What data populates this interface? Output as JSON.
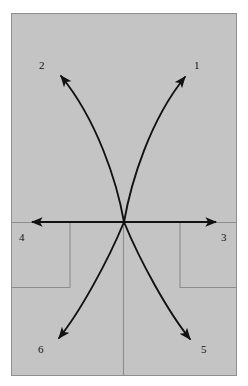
{
  "figure": {
    "type": "vector-diagram",
    "panel": {
      "background_color": "#c4c4c4",
      "border_color": "#8f8f8f",
      "x": 11,
      "y": 13,
      "width": 226,
      "height": 363
    },
    "page_background_color": "#ffffff",
    "stroke_color": "#121212",
    "guide_color": "#8d8d8d",
    "origin": {
      "x": 124,
      "y": 222
    },
    "axis": {
      "name": "horizontal-axis",
      "x_start": 30,
      "x_end": 218,
      "y": 222,
      "double_headed": true
    },
    "center_line": {
      "name": "vertical-guide",
      "x": 123,
      "y_start": 222,
      "y_end": 376
    },
    "guide_boxes": [
      {
        "name": "left-guide-box",
        "x": 11,
        "y": 222,
        "width": 59,
        "height": 65
      },
      {
        "name": "right-guide-box",
        "x": 180,
        "y": 222,
        "width": 57,
        "height": 65
      }
    ],
    "arrows": [
      {
        "id": "arrow-1",
        "label": "1",
        "direction": "upper-right",
        "curved": true,
        "path": "M124,222 C131,182 150,120 187,74",
        "tip": {
          "x": 187,
          "y": 74
        },
        "label_pos": {
          "x": 194,
          "y": 60
        }
      },
      {
        "id": "arrow-2",
        "label": "2",
        "direction": "upper-left",
        "curved": true,
        "path": "M124,222 C117,182 97,120 59,73",
        "tip": {
          "x": 59,
          "y": 73
        },
        "label_pos": {
          "x": 39,
          "y": 60
        }
      },
      {
        "id": "arrow-3",
        "label": "3",
        "direction": "right",
        "curved": false,
        "path": "M124,222 L218,222",
        "tip": {
          "x": 218,
          "y": 222
        },
        "label_pos": {
          "x": 221,
          "y": 232
        }
      },
      {
        "id": "arrow-4",
        "label": "4",
        "direction": "left",
        "curved": false,
        "path": "M124,222 L30,222",
        "tip": {
          "x": 30,
          "y": 222
        },
        "label_pos": {
          "x": 19,
          "y": 232
        }
      },
      {
        "id": "arrow-5",
        "label": "5",
        "direction": "lower-right",
        "curved": true,
        "path": "M124,222 C140,261 168,312 192,342",
        "tip": {
          "x": 192,
          "y": 342
        },
        "label_pos": {
          "x": 201,
          "y": 344
        }
      },
      {
        "id": "arrow-6",
        "label": "6",
        "direction": "lower-left",
        "curved": true,
        "path": "M124,222 C108,261 80,312 57,341",
        "tip": {
          "x": 57,
          "y": 341
        },
        "label_pos": {
          "x": 38,
          "y": 344
        }
      }
    ],
    "labels": {
      "one": "1",
      "two": "2",
      "three": "3",
      "four": "4",
      "five": "5",
      "six": "6"
    }
  }
}
